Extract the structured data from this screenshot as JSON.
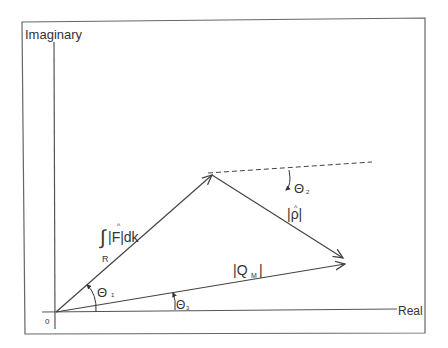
{
  "diagram": {
    "axes": {
      "y_label": "Imaginary",
      "x_label": "Real",
      "origin_label": "0"
    },
    "vectors": [
      {
        "name": "integral-F",
        "label_integral": "∫",
        "label_sub": "R",
        "label_main": "|F|dk",
        "label_hat": "^"
      },
      {
        "name": "rho",
        "label": "|ρ|",
        "label_hat": "^"
      },
      {
        "name": "Q_M",
        "label": "|Q",
        "label_sub": "M",
        "label_end": "|"
      }
    ],
    "angles": [
      {
        "name": "theta1",
        "symbol": "Θ",
        "sub": "1"
      },
      {
        "name": "theta2",
        "symbol": "Θ",
        "sub": "2"
      },
      {
        "name": "theta3",
        "symbol": "Θ",
        "sub": "3"
      }
    ],
    "colors": {
      "line": "#444444",
      "frame": "#666666"
    }
  }
}
